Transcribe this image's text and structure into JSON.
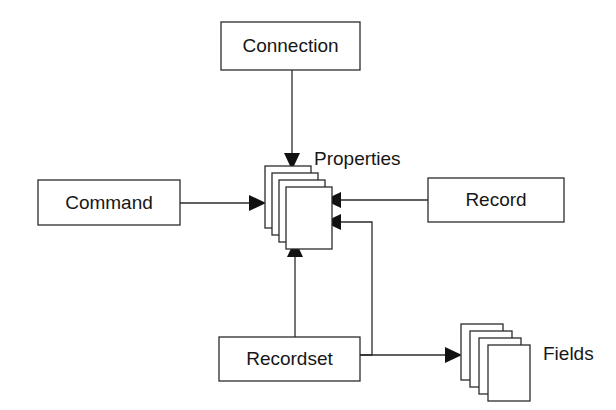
{
  "diagram": {
    "background_color": "#ffffff",
    "line_color": "#2b2b2b",
    "text_color": "#161616",
    "nodes": [
      {
        "id": "connection",
        "label": "Connection",
        "shape": "rectangle"
      },
      {
        "id": "command",
        "label": "Command",
        "shape": "rectangle"
      },
      {
        "id": "record",
        "label": "Record",
        "shape": "rectangle"
      },
      {
        "id": "recordset",
        "label": "Recordset",
        "shape": "rectangle"
      },
      {
        "id": "properties",
        "label": "Properties",
        "shape": "card-stack",
        "card_count": 4
      },
      {
        "id": "fields",
        "label": "Fields",
        "shape": "card-stack",
        "card_count": 4
      }
    ],
    "edges": [
      {
        "from": "connection",
        "to": "properties",
        "arrow": "down",
        "routing": "straight"
      },
      {
        "from": "command",
        "to": "properties",
        "arrow": "right",
        "routing": "straight"
      },
      {
        "from": "record",
        "to": "properties",
        "arrow": "left",
        "routing": "straight"
      },
      {
        "from": "recordset",
        "to": "properties",
        "arrow": "up",
        "routing": "straight"
      },
      {
        "from": "recordset",
        "to": "properties",
        "arrow": "left",
        "routing": "orthogonal"
      },
      {
        "from": "recordset",
        "to": "fields",
        "arrow": "right",
        "routing": "straight"
      }
    ]
  }
}
